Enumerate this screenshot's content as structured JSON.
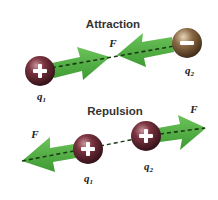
{
  "diagram": {
    "colors": {
      "arrow": "#4fae3f",
      "positive_charge": "#5a2630",
      "negative_charge": "#6b4a2c",
      "dash": "#1a3a14"
    },
    "attraction": {
      "title": "Attraction",
      "force_label": "F",
      "charges": [
        {
          "name": "q",
          "subscript": "1",
          "sign": "+"
        },
        {
          "name": "q",
          "subscript": "2",
          "sign": "−"
        }
      ]
    },
    "repulsion": {
      "title": "Repulsion",
      "force_label_left": "F",
      "force_label_right": "F",
      "charges": [
        {
          "name": "q",
          "subscript": "1",
          "sign": "+"
        },
        {
          "name": "q",
          "subscript": "2",
          "sign": "+"
        }
      ]
    }
  }
}
